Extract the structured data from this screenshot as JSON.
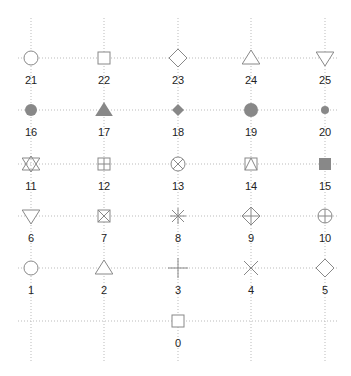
{
  "chart_data": {
    "type": "scatter",
    "title": "",
    "xlabel": "",
    "ylabel": "",
    "grid": true,
    "grid_style": "dotted",
    "symbol_color": "#888888",
    "grid_color": "#bbbbbb",
    "x_positions": [
      31,
      104,
      178,
      251,
      325
    ],
    "y_positions": [
      58,
      110,
      164,
      216,
      268,
      321
    ],
    "points": [
      {
        "pch": 21,
        "label": "21",
        "col": 0,
        "row": 0,
        "shape": "circle-open"
      },
      {
        "pch": 22,
        "label": "22",
        "col": 1,
        "row": 0,
        "shape": "square-open"
      },
      {
        "pch": 23,
        "label": "23",
        "col": 2,
        "row": 0,
        "shape": "diamond-open"
      },
      {
        "pch": 24,
        "label": "24",
        "col": 3,
        "row": 0,
        "shape": "triangle-up-open"
      },
      {
        "pch": 25,
        "label": "25",
        "col": 4,
        "row": 0,
        "shape": "triangle-down-open"
      },
      {
        "pch": 16,
        "label": "16",
        "col": 0,
        "row": 1,
        "shape": "circle-filled"
      },
      {
        "pch": 17,
        "label": "17",
        "col": 1,
        "row": 1,
        "shape": "triangle-up-filled"
      },
      {
        "pch": 18,
        "label": "18",
        "col": 2,
        "row": 1,
        "shape": "diamond-filled-small"
      },
      {
        "pch": 19,
        "label": "19",
        "col": 3,
        "row": 1,
        "shape": "circle-filled-large"
      },
      {
        "pch": 20,
        "label": "20",
        "col": 4,
        "row": 1,
        "shape": "circle-filled-small"
      },
      {
        "pch": 11,
        "label": "11",
        "col": 0,
        "row": 2,
        "shape": "star-of-david"
      },
      {
        "pch": 12,
        "label": "12",
        "col": 1,
        "row": 2,
        "shape": "square-plus"
      },
      {
        "pch": 13,
        "label": "13",
        "col": 2,
        "row": 2,
        "shape": "circle-cross"
      },
      {
        "pch": 14,
        "label": "14",
        "col": 3,
        "row": 2,
        "shape": "square-triangle"
      },
      {
        "pch": 15,
        "label": "15",
        "col": 4,
        "row": 2,
        "shape": "square-filled"
      },
      {
        "pch": 6,
        "label": "6",
        "col": 0,
        "row": 3,
        "shape": "triangle-down-open"
      },
      {
        "pch": 7,
        "label": "7",
        "col": 1,
        "row": 3,
        "shape": "square-cross"
      },
      {
        "pch": 8,
        "label": "8",
        "col": 2,
        "row": 3,
        "shape": "asterisk"
      },
      {
        "pch": 9,
        "label": "9",
        "col": 3,
        "row": 3,
        "shape": "diamond-plus"
      },
      {
        "pch": 10,
        "label": "10",
        "col": 4,
        "row": 3,
        "shape": "circle-plus"
      },
      {
        "pch": 1,
        "label": "1",
        "col": 0,
        "row": 4,
        "shape": "circle-open"
      },
      {
        "pch": 2,
        "label": "2",
        "col": 1,
        "row": 4,
        "shape": "triangle-up-open"
      },
      {
        "pch": 3,
        "label": "3",
        "col": 2,
        "row": 4,
        "shape": "plus"
      },
      {
        "pch": 4,
        "label": "4",
        "col": 3,
        "row": 4,
        "shape": "cross"
      },
      {
        "pch": 5,
        "label": "5",
        "col": 4,
        "row": 4,
        "shape": "diamond-open"
      },
      {
        "pch": 0,
        "label": "0",
        "col": 2,
        "row": 5,
        "shape": "square-open"
      }
    ]
  }
}
